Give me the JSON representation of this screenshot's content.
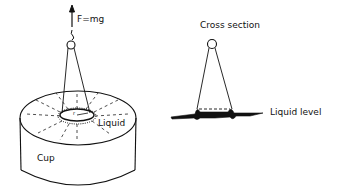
{
  "left_figure": {
    "force_label": "F=mg",
    "liquid_label": "Liquid",
    "cup_label": "Cup",
    "radius_label": "r"
  },
  "right_figure": {
    "title": "Cross section",
    "liquid_level_label": "Liquid level"
  }
}
